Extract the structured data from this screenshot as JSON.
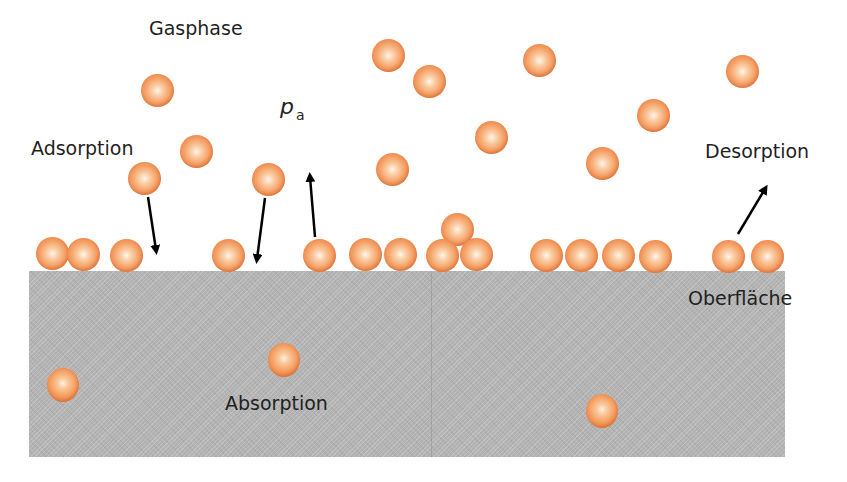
{
  "diagram": {
    "labels": {
      "gas_phase": "Gasphase",
      "partial_pressure_symbol": "p",
      "partial_pressure_subscript": "a",
      "adsorption": "Adsorption",
      "desorption": "Desorption",
      "surface": "Oberfläche",
      "absorption": "Absorption"
    },
    "regions": [
      "gas_phase",
      "surface",
      "bulk"
    ],
    "particle_counts": {
      "gas_phase": 14,
      "adsorbed_on_surface": 18,
      "absorbed_in_bulk": 3
    },
    "processes": [
      {
        "name": "Adsorption",
        "direction": "gas-to-surface",
        "arrows": 2
      },
      {
        "name": "Desorption",
        "direction": "surface-to-gas",
        "arrows": 2
      },
      {
        "name": "Absorption",
        "direction": "into-bulk",
        "arrows": 0
      }
    ],
    "colors": {
      "particle": "#f29a5e",
      "particle_highlight": "#fff6ee",
      "surface_bulk": "#b3b3b3",
      "arrow": "#000000",
      "text": "#1f1f1f",
      "background": "#ffffff"
    }
  }
}
